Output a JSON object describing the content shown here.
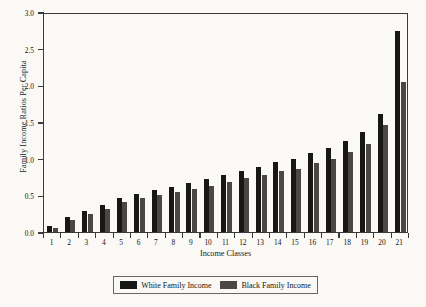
{
  "chart_data": {
    "type": "bar",
    "title": "",
    "xlabel": "Income Classes",
    "ylabel": "Family Income Ratios Per Capita",
    "ylim": [
      0.0,
      3.0
    ],
    "ytick_labels": [
      "0.0",
      "0.5",
      "1.0",
      "1.5",
      "2.0",
      "2.5",
      "3.0"
    ],
    "ytick_values": [
      0.0,
      0.5,
      1.0,
      1.5,
      2.0,
      2.5,
      3.0
    ],
    "grid": false,
    "legend_position": "bottom",
    "categories": [
      "1",
      "2",
      "3",
      "4",
      "5",
      "6",
      "7",
      "8",
      "9",
      "10",
      "11",
      "12",
      "13",
      "14",
      "15",
      "16",
      "17",
      "18",
      "19",
      "20",
      "21"
    ],
    "series": [
      {
        "name": "White Family Income",
        "color": "#171717",
        "values": [
          0.08,
          0.2,
          0.28,
          0.37,
          0.46,
          0.52,
          0.57,
          0.62,
          0.67,
          0.72,
          0.78,
          0.83,
          0.89,
          0.95,
          1.0,
          1.08,
          1.15,
          1.24,
          1.36,
          1.61,
          2.74
        ]
      },
      {
        "name": "Black Family Income",
        "color": "#4a4744",
        "values": [
          0.06,
          0.17,
          0.24,
          0.31,
          0.41,
          0.46,
          0.5,
          0.55,
          0.58,
          0.63,
          0.68,
          0.73,
          0.78,
          0.83,
          0.86,
          0.94,
          1.0,
          1.09,
          1.2,
          1.46,
          2.05
        ]
      }
    ]
  },
  "legend": {
    "items": [
      {
        "label": "White Family Income",
        "swatch": "white-income-swatch"
      },
      {
        "label": "Black Family Income",
        "swatch": "black-income-swatch"
      }
    ]
  }
}
